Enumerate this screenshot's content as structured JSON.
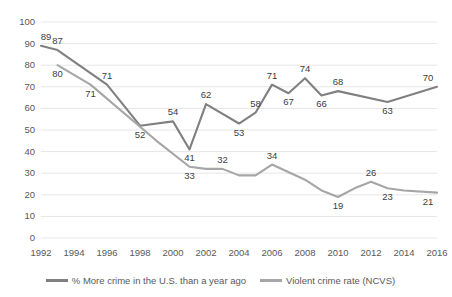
{
  "chart_data": {
    "type": "line",
    "title": "",
    "xlabel": "",
    "ylabel": "",
    "ylim": [
      0,
      100
    ],
    "ytick_step": 10,
    "grid": true,
    "legend_position": "bottom",
    "x": [
      1992,
      1993,
      1994,
      1995,
      1996,
      1997,
      1998,
      1999,
      2000,
      2001,
      2002,
      2003,
      2004,
      2005,
      2006,
      2007,
      2008,
      2009,
      2010,
      2011,
      2012,
      2013,
      2014,
      2015,
      2016
    ],
    "categories": [
      "1992",
      "1994",
      "1996",
      "1998",
      "2000",
      "2002",
      "2004",
      "2006",
      "2008",
      "2010",
      "2012",
      "2014",
      "2016"
    ],
    "yticks": [
      "0",
      "10",
      "20",
      "30",
      "40",
      "50",
      "60",
      "70",
      "80",
      "90",
      "100"
    ],
    "series": [
      {
        "name": "% More crime in the U.S. than a year ago",
        "color": "#808080",
        "points": [
          {
            "x": 1992,
            "y": 89,
            "label": "89"
          },
          {
            "x": 1993,
            "y": 87,
            "label": "87"
          },
          {
            "x": 1996,
            "y": 71,
            "label": "71"
          },
          {
            "x": 1998,
            "y": 52,
            "label": "52"
          },
          {
            "x": 2000,
            "y": 54,
            "label": "54"
          },
          {
            "x": 2001,
            "y": 41,
            "label": "41"
          },
          {
            "x": 2002,
            "y": 62,
            "label": "62"
          },
          {
            "x": 2004,
            "y": 53,
            "label": "53"
          },
          {
            "x": 2005,
            "y": 58,
            "label": "58"
          },
          {
            "x": 2006,
            "y": 71,
            "label": "71"
          },
          {
            "x": 2007,
            "y": 67,
            "label": "67"
          },
          {
            "x": 2008,
            "y": 74,
            "label": "74"
          },
          {
            "x": 2009,
            "y": 66,
            "label": "66"
          },
          {
            "x": 2010,
            "y": 68,
            "label": "68"
          },
          {
            "x": 2013,
            "y": 63,
            "label": "63"
          },
          {
            "x": 2016,
            "y": 70,
            "label": "70"
          }
        ]
      },
      {
        "name": "Violent crime rate (NCVS)",
        "color": "#a6a6a6",
        "points": [
          {
            "x": 1993,
            "y": 80,
            "label": "80"
          },
          {
            "x": 1995,
            "y": 71,
            "label": "71"
          },
          {
            "x": 1999,
            "y": 45,
            "label": ""
          },
          {
            "x": 2001,
            "y": 33,
            "label": "33"
          },
          {
            "x": 2002,
            "y": 32,
            "label": ""
          },
          {
            "x": 2003,
            "y": 32,
            "label": "32"
          },
          {
            "x": 2004,
            "y": 29,
            "label": ""
          },
          {
            "x": 2005,
            "y": 29,
            "label": ""
          },
          {
            "x": 2006,
            "y": 34,
            "label": "34"
          },
          {
            "x": 2008,
            "y": 27,
            "label": ""
          },
          {
            "x": 2009,
            "y": 22,
            "label": ""
          },
          {
            "x": 2010,
            "y": 19,
            "label": "19"
          },
          {
            "x": 2011,
            "y": 23,
            "label": ""
          },
          {
            "x": 2012,
            "y": 26,
            "label": "26"
          },
          {
            "x": 2013,
            "y": 23,
            "label": "23"
          },
          {
            "x": 2014,
            "y": 22,
            "label": ""
          },
          {
            "x": 2016,
            "y": 21,
            "label": "21"
          }
        ]
      }
    ]
  },
  "legend": {
    "entries": [
      {
        "label": "% More crime in the U.S. than a year ago",
        "color": "#808080"
      },
      {
        "label": "Violent crime rate (NCVS)",
        "color": "#a6a6a6"
      }
    ]
  },
  "colors": {
    "gridline": "#e6e6e6",
    "axis_text": "#595959",
    "label_text": "#404040",
    "background": "#ffffff"
  }
}
